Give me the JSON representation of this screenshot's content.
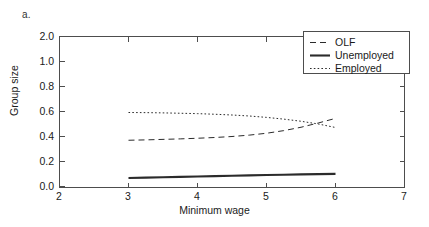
{
  "figure": {
    "panel_letter": "a.",
    "background_color": "#ffffff",
    "line_color": "#2b2b2b",
    "axis_color": "#4d4d4d"
  },
  "chart_data": {
    "type": "line",
    "title": "",
    "subtitle": "",
    "panel_label": "a.",
    "xlabel": "Minimum wage",
    "ylabel": "Group size",
    "xlim": [
      2,
      7
    ],
    "ylim": [
      0.0,
      2.0
    ],
    "grid": false,
    "legend_position": "top-right",
    "xticks": [
      2,
      3,
      4,
      5,
      6,
      7
    ],
    "xtick_labels": [
      "2",
      "3",
      "4",
      "5",
      "6",
      "7"
    ],
    "yticks": [
      0.0,
      0.2,
      0.4,
      0.6,
      0.8,
      1.0,
      2.0
    ],
    "ytick_labels": [
      "0.0",
      "0.2",
      "0.4",
      "0.6",
      "0.8",
      "1.0",
      "2.0"
    ],
    "x": [
      3.0,
      3.25,
      3.5,
      3.75,
      4.0,
      4.25,
      4.5,
      4.75,
      5.0,
      5.25,
      5.5,
      5.75,
      6.0
    ],
    "series": [
      {
        "name": "OLF",
        "style": "dashed",
        "values": [
          0.37,
          0.373,
          0.377,
          0.381,
          0.386,
          0.392,
          0.4,
          0.411,
          0.426,
          0.447,
          0.474,
          0.508,
          0.545
        ]
      },
      {
        "name": "Unemployed",
        "style": "solid",
        "values": [
          0.068,
          0.071,
          0.074,
          0.077,
          0.08,
          0.083,
          0.086,
          0.089,
          0.092,
          0.094,
          0.097,
          0.099,
          0.101
        ]
      },
      {
        "name": "Employed",
        "style": "dotted",
        "values": [
          0.592,
          0.591,
          0.589,
          0.586,
          0.583,
          0.578,
          0.572,
          0.564,
          0.553,
          0.539,
          0.522,
          0.5,
          0.472
        ]
      }
    ],
    "legend_entries": [
      {
        "label": "OLF",
        "style": "dashed"
      },
      {
        "label": "Unemployed",
        "style": "solid"
      },
      {
        "label": "Employed",
        "style": "dotted"
      }
    ]
  }
}
